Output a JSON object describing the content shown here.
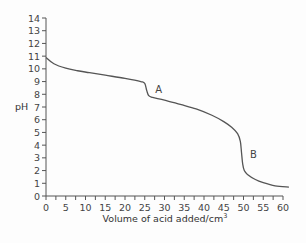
{
  "chart_data": {
    "type": "line",
    "title": "",
    "xlabel": "Volume of acid added/cm",
    "xlabel_superscript": "3",
    "ylabel": "pH",
    "xlim": [
      0,
      62
    ],
    "ylim": [
      0,
      14
    ],
    "x_ticks": [
      0,
      5,
      10,
      15,
      20,
      25,
      30,
      35,
      40,
      45,
      50,
      55,
      60
    ],
    "x_minor_ticks_step": 2.5,
    "y_ticks": [
      0,
      1,
      2,
      3,
      4,
      5,
      6,
      7,
      8,
      9,
      10,
      11,
      12,
      13,
      14
    ],
    "grid": false,
    "legend": null,
    "series": [
      {
        "name": "titration curve",
        "color": "#555555",
        "x": [
          0,
          2,
          5,
          8,
          11,
          15,
          20,
          24,
          25,
          25.5,
          26,
          27,
          30,
          34,
          38,
          42,
          45,
          47,
          48.5,
          49.2,
          49.5,
          49.8,
          50.2,
          51,
          53,
          55,
          58,
          61.5
        ],
        "y": [
          10.9,
          10.4,
          10.05,
          9.85,
          9.7,
          9.5,
          9.25,
          9.0,
          8.85,
          8.3,
          7.9,
          7.75,
          7.55,
          7.2,
          6.85,
          6.35,
          5.85,
          5.4,
          4.9,
          4.3,
          3.4,
          2.5,
          2.0,
          1.7,
          1.3,
          1.05,
          0.8,
          0.7
        ]
      }
    ],
    "annotations": [
      {
        "text": "A",
        "x": 28.5,
        "y": 8.1
      },
      {
        "text": "B",
        "x": 52.5,
        "y": 3.0
      }
    ]
  }
}
